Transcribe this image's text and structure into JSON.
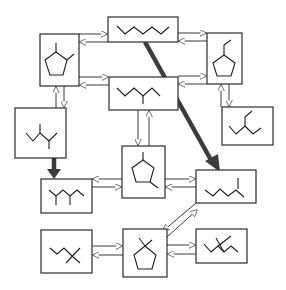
{
  "diagram": {
    "title": "",
    "colors": {
      "line": "#2b2b2b",
      "thick_arrow": "#3c3c3c",
      "background": "#ffffff"
    },
    "nodes": [
      {
        "id": "A",
        "structure": "1,2-dimethylcyclopentane",
        "x": 40,
        "y": 34,
        "w": 39,
        "h": 52
      },
      {
        "id": "B",
        "structure": "n-heptane",
        "x": 108,
        "y": 17,
        "w": 70,
        "h": 25
      },
      {
        "id": "C",
        "structure": "ethylcyclopentane",
        "x": 207,
        "y": 33,
        "w": 35,
        "h": 51
      },
      {
        "id": "D",
        "structure": "3-methylhexane",
        "x": 109,
        "y": 77,
        "w": 69,
        "h": 33
      },
      {
        "id": "E",
        "structure": "2,4-dimethylpentane",
        "x": 15,
        "y": 108,
        "w": 51,
        "h": 50
      },
      {
        "id": "F",
        "structure": "3-ethylpentane",
        "x": 222,
        "y": 107,
        "w": 51,
        "h": 38
      },
      {
        "id": "G",
        "structure": "1,3-dimethylcyclopentane",
        "x": 122,
        "y": 146,
        "w": 43,
        "h": 52
      },
      {
        "id": "H",
        "structure": "2,3-dimethylbutane-like (two branches)",
        "x": 41,
        "y": 179,
        "w": 51,
        "h": 34
      },
      {
        "id": "I",
        "structure": "2-methylhexane",
        "x": 196,
        "y": 170,
        "w": 60,
        "h": 33
      },
      {
        "id": "J",
        "structure": "2,2-dimethylpentane",
        "x": 41,
        "y": 230,
        "w": 51,
        "h": 43
      },
      {
        "id": "K",
        "structure": "1,1-dimethylcyclopentane",
        "x": 123,
        "y": 229,
        "w": 44,
        "h": 48
      },
      {
        "id": "L",
        "structure": "3,3-dimethylpentane",
        "x": 196,
        "y": 229,
        "w": 51,
        "h": 34
      }
    ],
    "edges": [
      {
        "from": "A",
        "to": "B",
        "type": "reversible"
      },
      {
        "from": "A",
        "to": "D",
        "type": "reversible"
      },
      {
        "from": "B",
        "to": "C",
        "type": "reversible"
      },
      {
        "from": "D",
        "to": "C",
        "type": "reversible"
      },
      {
        "from": "A",
        "to": "E",
        "type": "reversible"
      },
      {
        "from": "C",
        "to": "F",
        "type": "reversible"
      },
      {
        "from": "D",
        "to": "G",
        "type": "reversible"
      },
      {
        "from": "E",
        "to": "H",
        "type": "major (thick arrow)"
      },
      {
        "from": "B",
        "to": "I",
        "type": "major (thick arrow)"
      },
      {
        "from": "G",
        "to": "H",
        "type": "reversible"
      },
      {
        "from": "G",
        "to": "I",
        "type": "reversible"
      },
      {
        "from": "I",
        "to": "K",
        "type": "reversible"
      },
      {
        "from": "J",
        "to": "K",
        "type": "reversible"
      },
      {
        "from": "K",
        "to": "L",
        "type": "reversible"
      }
    ]
  }
}
